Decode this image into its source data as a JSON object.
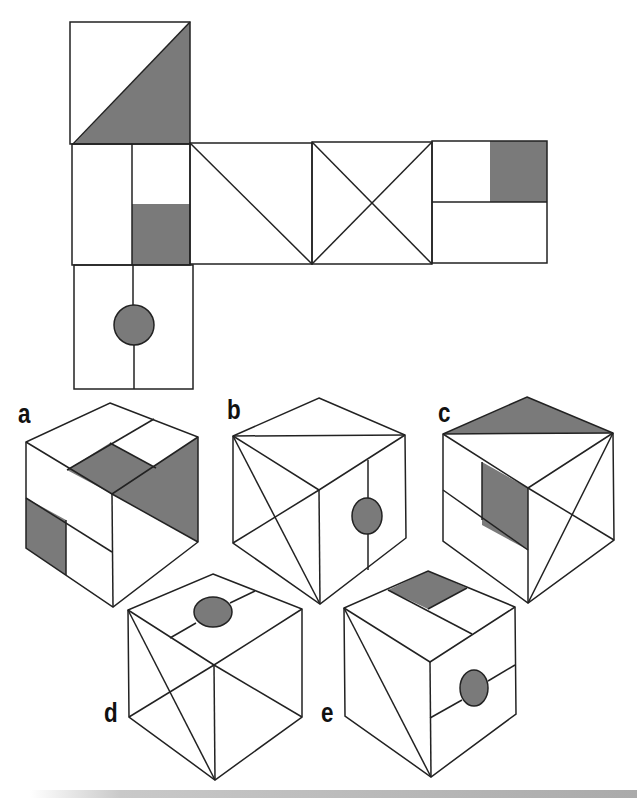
{
  "colors": {
    "stroke": "#222222",
    "shade": "#7a7a7a",
    "background": "#ffffff"
  },
  "net": {
    "description": "Unfolded cube net with six faces",
    "faces": [
      {
        "id": "top",
        "pattern": "diagonal-shaded-triangle"
      },
      {
        "id": "left",
        "pattern": "vertical-split-with-shaded-square"
      },
      {
        "id": "middle-1",
        "pattern": "single-diagonal"
      },
      {
        "id": "middle-2",
        "pattern": "diagonal-cross"
      },
      {
        "id": "right",
        "pattern": "horizontal-split-with-shaded-square"
      },
      {
        "id": "bottom",
        "pattern": "vertical-line-with-circle"
      }
    ]
  },
  "options": [
    {
      "label": "a",
      "name": "option-a"
    },
    {
      "label": "b",
      "name": "option-b"
    },
    {
      "label": "c",
      "name": "option-c"
    },
    {
      "label": "d",
      "name": "option-d"
    },
    {
      "label": "e",
      "name": "option-e"
    }
  ]
}
